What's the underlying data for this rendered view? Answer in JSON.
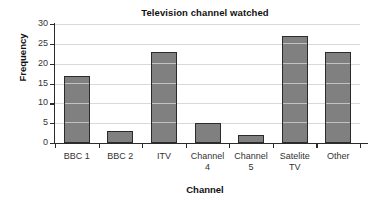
{
  "chart_data": {
    "type": "bar",
    "title": "Television channel watched",
    "xlabel": "Channel",
    "ylabel": "Frequency",
    "categories": [
      "BBC 1",
      "BBC 2",
      "ITV",
      "Channel 4",
      "Channel 5",
      "Satelite TV",
      "Other"
    ],
    "values": [
      17,
      3,
      23,
      5,
      2,
      27,
      23
    ],
    "ylim": [
      0,
      30
    ],
    "ytick_labels": [
      "30",
      "25",
      "20",
      "15",
      "10",
      "5",
      "0"
    ],
    "ytick_values": [
      30,
      25,
      20,
      15,
      10,
      5,
      0
    ],
    "ytick_step": 5,
    "grid": "horizontal-light-over-bars",
    "legend": "none",
    "bar_color": "#808080",
    "bar_edge_color": "#2b2b2b",
    "gridline_color": "#d9d9d9",
    "axis_color": "#2b2b2b",
    "background_color": "#ffffff"
  }
}
